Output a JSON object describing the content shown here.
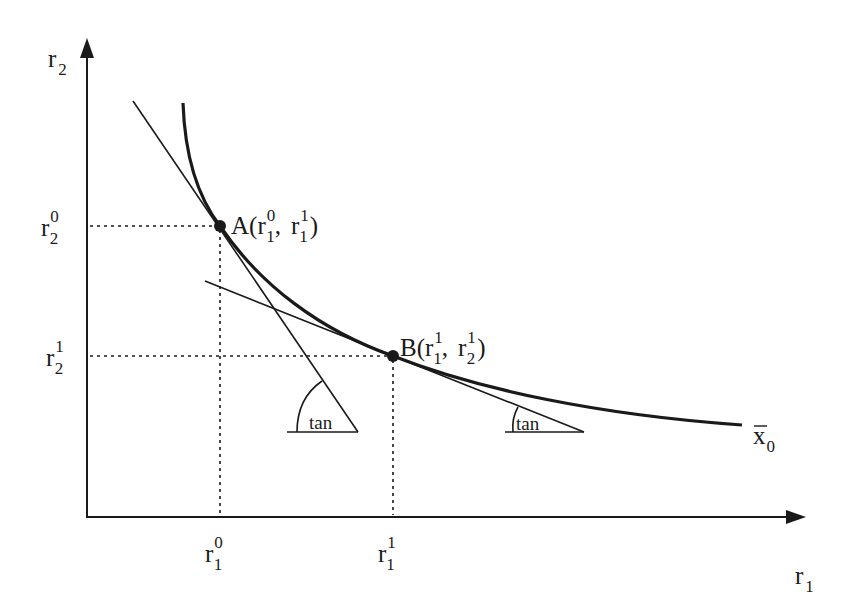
{
  "diagram": {
    "type": "isoquant",
    "axes": {
      "x": {
        "label": "r",
        "label_sub": "1"
      },
      "y": {
        "label": "r",
        "label_sub": "2"
      }
    },
    "curve": {
      "label": "x",
      "label_sub": "0",
      "overbar": true
    },
    "points": [
      {
        "id": "A",
        "label": "A(",
        "coord1_base": "r",
        "coord1_sup": "0",
        "coord1_sub": "1",
        "sep": ",",
        "coord2_base": "r",
        "coord2_sup": "1",
        "coord2_sub": "1",
        "close": ")"
      },
      {
        "id": "B",
        "label": "B(",
        "coord1_base": "r",
        "coord1_sup": "1",
        "coord1_sub": "1",
        "sep": ",",
        "coord2_base": "r",
        "coord2_sup": "1",
        "coord2_sub": "2",
        "close": ")"
      }
    ],
    "y_ticks": [
      {
        "base": "r",
        "sup": "0",
        "sub": "2"
      },
      {
        "base": "r",
        "sup": "1",
        "sub": "2"
      }
    ],
    "x_ticks": [
      {
        "base": "r",
        "sup": "0",
        "sub": "1"
      },
      {
        "base": "r",
        "sup": "1",
        "sub": "1"
      }
    ],
    "angle_labels": [
      "tan",
      "tan"
    ]
  },
  "colors": {
    "line": "#1a1a1a",
    "background": "#ffffff"
  }
}
